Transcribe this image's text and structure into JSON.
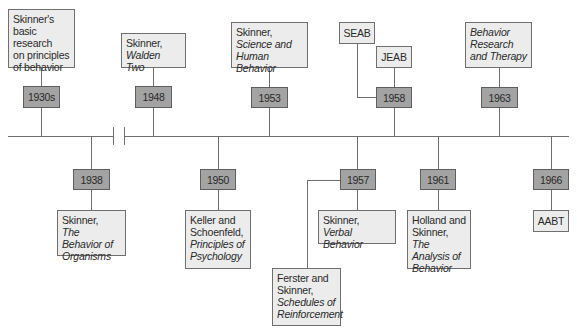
{
  "timeline": {
    "above": [
      {
        "year": "1930s",
        "lines": [
          {
            "text": "Skinner's",
            "italic": false
          },
          {
            "text": "basic research",
            "italic": false
          },
          {
            "text": "on principles",
            "italic": false
          },
          {
            "text": "of behavior",
            "italic": false
          }
        ]
      },
      {
        "year": "1948",
        "lines": [
          {
            "text": "Skinner,",
            "italic": false
          },
          {
            "text": "Walden Two",
            "italic": true
          }
        ]
      },
      {
        "year": "1953",
        "lines": [
          {
            "text": "Skinner,",
            "italic": false
          },
          {
            "text": "Science and",
            "italic": true
          },
          {
            "text": "Human Behavior",
            "italic": true
          }
        ]
      },
      {
        "year": "1958",
        "events": [
          "SEAB",
          "JEAB"
        ]
      },
      {
        "year": "1963",
        "lines": [
          {
            "text": "Behavior",
            "italic": true
          },
          {
            "text": "Research and",
            "italic": true
          },
          {
            "text": "Therapy",
            "italic": true
          }
        ]
      }
    ],
    "below": [
      {
        "year": "1938",
        "lines": [
          {
            "text": "Skinner,",
            "italic": false
          },
          {
            "text": "The Behavior",
            "italic": true
          },
          {
            "text": "of Organisms",
            "italic": true
          }
        ]
      },
      {
        "year": "1950",
        "lines": [
          {
            "text": "Keller and",
            "italic": false
          },
          {
            "text": "Schoenfeld,",
            "italic": false
          },
          {
            "text": "Principles of",
            "italic": true
          },
          {
            "text": "Psychology",
            "italic": true
          }
        ]
      },
      {
        "year": "1957",
        "events": [
          {
            "lines": [
              {
                "text": "Skinner,",
                "italic": false
              },
              {
                "text": "Verbal Behavior",
                "italic": true
              }
            ]
          },
          {
            "lines": [
              {
                "text": "Ferster and",
                "italic": false
              },
              {
                "text": "Skinner,",
                "italic": false
              },
              {
                "text": "Schedules of",
                "italic": true
              },
              {
                "text": "Reinforcement",
                "italic": true
              }
            ]
          }
        ]
      },
      {
        "year": "1961",
        "lines": [
          {
            "text": "Holland and",
            "italic": false
          },
          {
            "text": "Skinner, ",
            "italic": false,
            "suffix": "The"
          },
          {
            "text": "Analysis of",
            "italic": true
          },
          {
            "text": "Behavior",
            "italic": true
          }
        ]
      },
      {
        "year": "1966",
        "events": [
          "AABT"
        ]
      }
    ]
  },
  "colors": {
    "year_box": "#a3a3a3",
    "event_box": "#ececec",
    "line": "#6e6e6e"
  }
}
